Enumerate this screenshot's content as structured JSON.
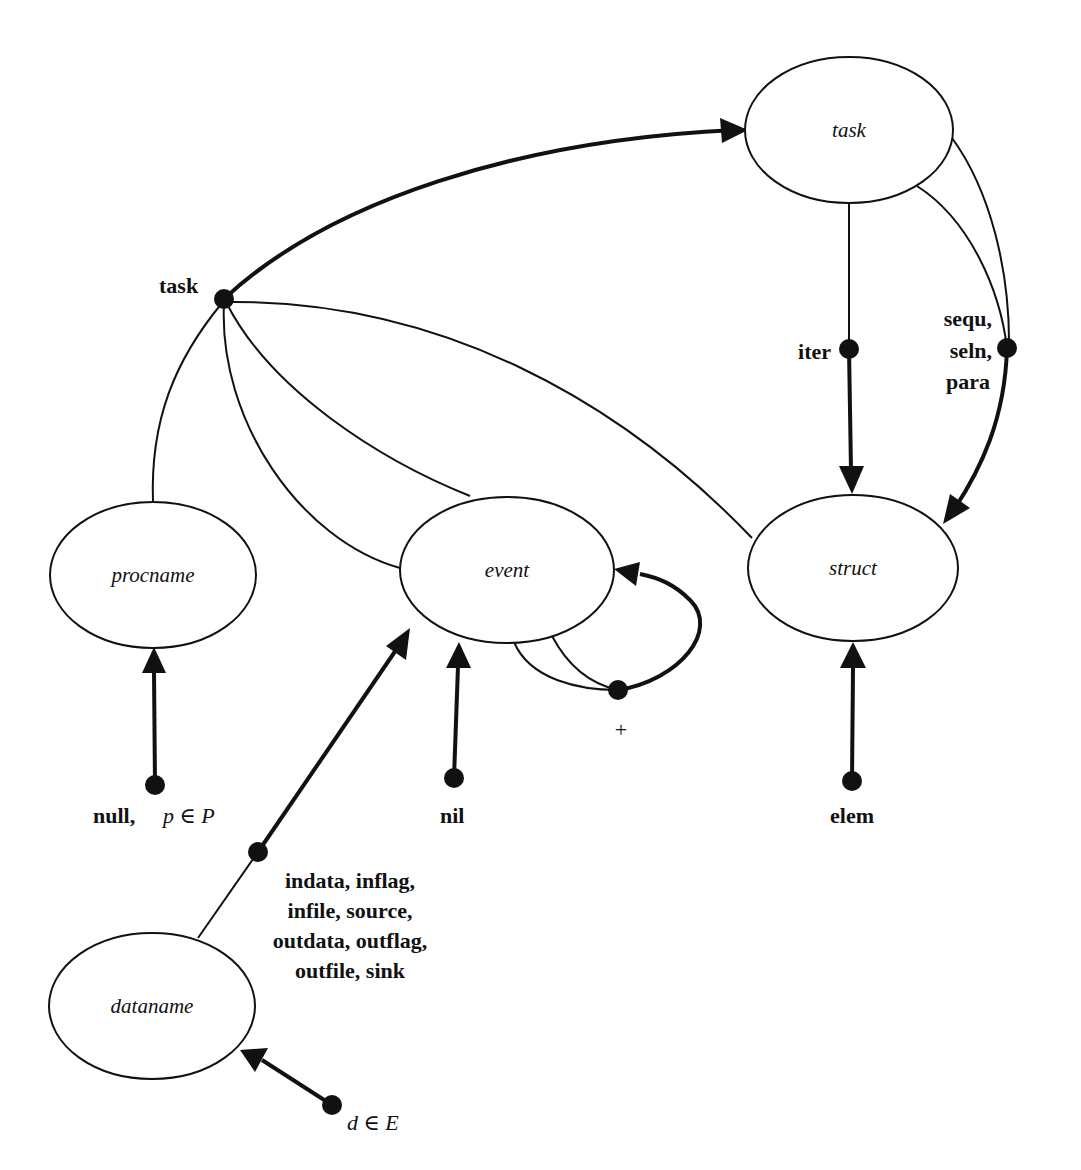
{
  "nodes": {
    "task": {
      "label": "task"
    },
    "procname": {
      "label": "procname"
    },
    "event": {
      "label": "event"
    },
    "struct": {
      "label": "struct"
    },
    "dataname": {
      "label": "dataname"
    }
  },
  "labels": {
    "task_hub": "task",
    "iter": "iter",
    "sequ_line1": "sequ,",
    "sequ_line2": "seln,",
    "sequ_line3": "para",
    "plus": "+",
    "null_text": "null,",
    "null_math": "p ∈ P",
    "nil": "nil",
    "elem": "elem",
    "data_line1": "indata,  inflag,",
    "data_line2": "infile,  source,",
    "data_line3": "outdata,  outflag,",
    "data_line4": "outfile,  sink",
    "d_math": "d ∈ E"
  },
  "colors": {
    "ink": "#111111",
    "background": "#ffffff"
  }
}
